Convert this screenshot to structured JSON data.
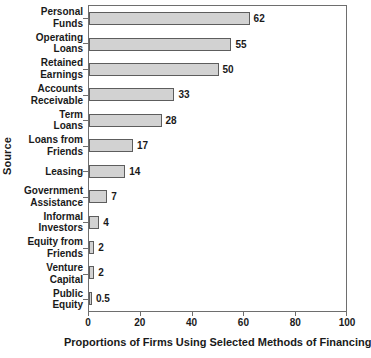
{
  "chart_data": {
    "type": "bar",
    "orientation": "horizontal",
    "title": "",
    "xlabel": "Proportions of Firms Using Selected Methods of Financing",
    "ylabel": "Source",
    "xlim": [
      0,
      100
    ],
    "xticks": [
      0,
      20,
      40,
      60,
      80,
      100
    ],
    "xtick_labels": [
      "0",
      "20",
      "40",
      "60",
      "80",
      "100"
    ],
    "grid": false,
    "legend": false,
    "bar_color": "#d2d2d2",
    "bar_border_color": "#5d5d5d",
    "axis_color": "#6e6e6e",
    "categories": [
      "Personal Funds",
      "Operating Loans",
      "Retained Earnings",
      "Accounts Receivable",
      "Term Loans",
      "Loans from Friends",
      "Leasing",
      "Government Assistance",
      "Informal Investors",
      "Equity from Friends",
      "Venture Capital",
      "Public Equity"
    ],
    "category_lines": [
      [
        "Personal",
        "Funds"
      ],
      [
        "Operating",
        "Loans"
      ],
      [
        "Retained",
        "Earnings"
      ],
      [
        "Accounts",
        "Receivable"
      ],
      [
        "Term",
        "Loans"
      ],
      [
        "Loans from",
        "Friends"
      ],
      [
        "Leasing",
        ""
      ],
      [
        "Government",
        "Assistance"
      ],
      [
        "Informal",
        "Investors"
      ],
      [
        "Equity from",
        "Friends"
      ],
      [
        "Venture",
        "Capital"
      ],
      [
        "Public",
        "Equity"
      ]
    ],
    "values": [
      62,
      55,
      50,
      33,
      28,
      17,
      14,
      7,
      4,
      2,
      2,
      0.5
    ],
    "value_labels": [
      "62",
      "55",
      "50",
      "33",
      "28",
      "17",
      "14",
      "7",
      "4",
      "2",
      "2",
      "0.5"
    ]
  }
}
